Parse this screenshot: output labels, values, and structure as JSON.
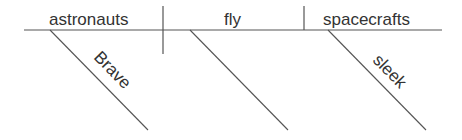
{
  "diagram": {
    "type": "sentence-diagram",
    "subject": "astronauts",
    "verb": "fly",
    "object": "spacecrafts",
    "modifiers": {
      "subject": "Brave",
      "object": "sleek"
    },
    "line_color": "#555555",
    "text_color": "#333333"
  }
}
